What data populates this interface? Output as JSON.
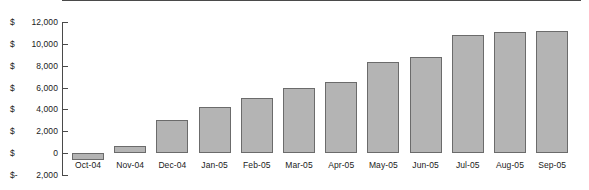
{
  "chart_data": {
    "type": "bar",
    "title": "",
    "xlabel": "",
    "ylabel": "",
    "categories": [
      "Oct-04",
      "Nov-04",
      "Dec-04",
      "Jan-05",
      "Feb-05",
      "Mar-05",
      "Apr-05",
      "May-05",
      "Jun-05",
      "Jul-05",
      "Aug-05",
      "Sep-05"
    ],
    "values": [
      -600,
      600,
      3000,
      4200,
      5000,
      6000,
      6500,
      8300,
      8800,
      10800,
      11100,
      11200
    ],
    "ylim": [
      -2000,
      12000
    ],
    "ytick_values": [
      12000,
      10000,
      8000,
      6000,
      4000,
      2000,
      0,
      -2000
    ],
    "ytick_labels": [
      "$ 12,000",
      "$ 10,000",
      "$  8,000",
      "$  6,000",
      "$  4,000",
      "$  2,000",
      "$      0",
      "$ -2,000"
    ],
    "ytick_currency": [
      "$",
      "$",
      "$",
      "$",
      "$",
      "$",
      "$",
      "$-"
    ],
    "ytick_numbers": [
      "12,000",
      "10,000",
      "8,000",
      "6,000",
      "4,000",
      "2,000",
      "0",
      "2,000"
    ],
    "grid": false,
    "legend": false,
    "legend_position": "none",
    "series": [
      {
        "name": "Cumulative Cash Flow",
        "values": [
          -600,
          600,
          3000,
          4200,
          5000,
          6000,
          6500,
          8300,
          8800,
          10800,
          11100,
          11200
        ]
      }
    ]
  },
  "style": {
    "bar_fill": "#b4b4b4",
    "bar_border": "#6b6b6b",
    "axis_color": "#4a4a4a",
    "text_color": "#1a1a1a",
    "background": "#ffffff"
  }
}
